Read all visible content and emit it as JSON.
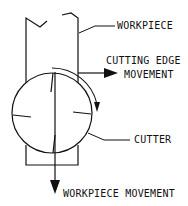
{
  "diagram": {
    "colors": {
      "line": "#111111",
      "background": "#ffffff"
    },
    "labels": {
      "workpiece": "WORKPIECE",
      "cutting_edge_line1": "CUTTING EDGE",
      "cutting_edge_line2": "MOVEMENT",
      "cutter": "CUTTER",
      "workpiece_movement": "WORKPIECE MOVEMENT"
    },
    "icons": {
      "cutting_edge_arrow": "arrow-right-icon",
      "rotation_arrow": "arrow-clockwise-icon",
      "workpiece_movement_arrow": "arrow-down-icon"
    }
  }
}
